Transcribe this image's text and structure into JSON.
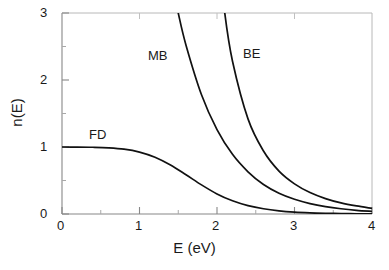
{
  "chart_data": {
    "type": "line",
    "title": "",
    "xlabel": "E (eV)",
    "ylabel": "n(E)",
    "xlim": [
      0,
      4
    ],
    "ylim": [
      0,
      3
    ],
    "xticks": [
      "0",
      "1",
      "2",
      "3",
      "4"
    ],
    "xtick_values": [
      0,
      1,
      2,
      3,
      4
    ],
    "yticks": [
      "0",
      "1",
      "2",
      "3"
    ],
    "ytick_values": [
      0,
      1,
      2,
      3
    ],
    "minor_xticks": [
      0.5,
      1.5,
      2.5,
      3.5
    ],
    "minor_yticks": [
      0.5,
      1.5,
      2.5
    ],
    "grid": false,
    "legend_position": "inline-annotations",
    "tick_direction": "in",
    "frame": "box",
    "line_color": "#000000",
    "background_color": "#ffffff",
    "annotations": [
      {
        "text": "FD",
        "x": 1.18,
        "y": 1.48
      },
      {
        "text": "MB",
        "x": 1.25,
        "y": 2.52
      },
      {
        "text": "BE",
        "x": 2.46,
        "y": 2.55
      }
    ],
    "series": [
      {
        "name": "FD",
        "label": "Fermi-Dirac",
        "x": [
          0.0,
          0.2,
          0.4,
          0.6,
          0.8,
          1.0,
          1.2,
          1.4,
          1.6,
          1.8,
          2.0,
          2.2,
          2.4,
          2.6,
          2.8,
          3.0,
          3.2,
          3.4,
          3.6,
          3.8,
          4.0
        ],
        "values": [
          1.0,
          0.999,
          0.996,
          0.988,
          0.968,
          0.924,
          0.847,
          0.731,
          0.586,
          0.435,
          0.3,
          0.197,
          0.125,
          0.078,
          0.048,
          0.029,
          0.018,
          0.011,
          0.0065,
          0.004,
          0.0024
        ]
      },
      {
        "name": "MB",
        "label": "Maxwell-Boltzmann",
        "x": [
          1.4,
          1.5,
          1.6,
          1.8,
          2.0,
          2.2,
          2.4,
          2.6,
          2.8,
          3.0,
          3.2,
          3.4,
          3.6,
          3.8,
          4.0
        ],
        "values": [
          3.56,
          3.0,
          2.52,
          1.78,
          1.26,
          0.89,
          0.63,
          0.44,
          0.31,
          0.22,
          0.156,
          0.11,
          0.078,
          0.055,
          0.039
        ]
      },
      {
        "name": "BE",
        "label": "Bose-Einstein",
        "x": [
          2.0,
          2.1,
          2.2,
          2.4,
          2.6,
          2.8,
          3.0,
          3.2,
          3.4,
          3.6,
          3.8,
          4.0
        ],
        "values": [
          4.1,
          3.0,
          2.28,
          1.42,
          0.94,
          0.64,
          0.45,
          0.32,
          0.23,
          0.165,
          0.12,
          0.085
        ]
      }
    ]
  },
  "axes": {
    "x_axis_label": "E (eV)",
    "y_axis_label": "n(E)",
    "x_tick_labels": [
      "0",
      "1",
      "2",
      "3",
      "4"
    ],
    "y_tick_labels": [
      "0",
      "1",
      "2",
      "3"
    ]
  },
  "labels": {
    "fd": "FD",
    "mb": "MB",
    "be": "BE"
  }
}
